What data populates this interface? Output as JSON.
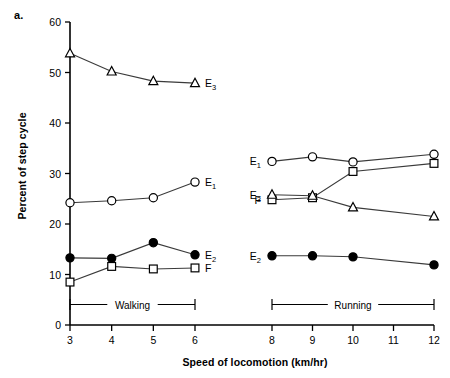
{
  "figure": {
    "panel_label": "a.",
    "ylabel": "Percent of step cycle",
    "xlabel": "Speed of locomotion (km/hr)"
  },
  "axes": {
    "y_ticks": [
      "0",
      "10",
      "20",
      "30",
      "40",
      "50",
      "60"
    ],
    "x_ticks": [
      "3",
      "4",
      "5",
      "6",
      "8",
      "9",
      "10",
      "11",
      "12"
    ]
  },
  "brackets": [
    {
      "label": "Walking",
      "from": 3,
      "to": 6
    },
    {
      "label": "Running",
      "from": 8,
      "to": 12
    }
  ],
  "series_labels": {
    "e1": "E",
    "e1_sub": "1",
    "e2": "E",
    "e2_sub": "2",
    "e3": "E",
    "e3_sub": "3",
    "f": "F"
  },
  "chart_data": {
    "type": "line",
    "title": "",
    "xlabel": "Speed of locomotion (km/hr)",
    "ylabel": "Percent of step cycle",
    "xlim": [
      3,
      12
    ],
    "ylim": [
      0,
      60
    ],
    "grid": false,
    "legend": "inline-labels",
    "x_break": [
      6,
      8
    ],
    "groups": [
      {
        "name": "Walking",
        "x": [
          3,
          4,
          5,
          6
        ],
        "series": [
          {
            "name": "E3",
            "marker": "open-triangle",
            "values": [
              53.8,
              50.2,
              48.3,
              47.9
            ],
            "label_side": "right"
          },
          {
            "name": "E1",
            "marker": "open-circle",
            "values": [
              24.2,
              24.6,
              25.2,
              28.3
            ],
            "label_side": "right"
          },
          {
            "name": "E2",
            "marker": "filled-circle",
            "values": [
              13.3,
              13.2,
              16.3,
              13.9
            ],
            "label_side": "right"
          },
          {
            "name": "F",
            "marker": "open-square",
            "values": [
              8.5,
              11.6,
              11.1,
              11.3
            ],
            "label_side": "right"
          }
        ]
      },
      {
        "name": "Running",
        "x": [
          8,
          9,
          10,
          12
        ],
        "series": [
          {
            "name": "E1",
            "marker": "open-circle",
            "values": [
              32.4,
              33.3,
              32.3,
              33.8
            ],
            "label_side": "left"
          },
          {
            "name": "F",
            "marker": "open-square",
            "values": [
              24.8,
              25.2,
              30.4,
              32.0
            ],
            "label_side": "left"
          },
          {
            "name": "E3",
            "marker": "open-triangle",
            "values": [
              25.8,
              25.6,
              23.3,
              21.5
            ],
            "label_side": "left"
          },
          {
            "name": "E2",
            "marker": "filled-circle",
            "values": [
              13.7,
              13.7,
              13.5,
              11.9
            ],
            "label_side": "left"
          }
        ]
      }
    ]
  }
}
